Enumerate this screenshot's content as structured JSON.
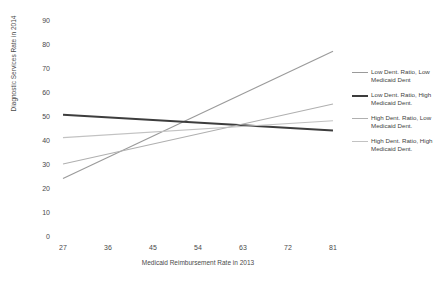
{
  "chart_data": {
    "type": "line",
    "title": "",
    "xlabel": "Medicaid Reimbursement Rate in 2013",
    "ylabel": "Diagnostic Services Rate in 2014",
    "xlim": [
      27,
      81
    ],
    "ylim": [
      0,
      90
    ],
    "xticks": [
      27,
      36,
      45,
      54,
      63,
      72,
      81
    ],
    "yticks": [
      0,
      10,
      20,
      30,
      40,
      50,
      60,
      70,
      80,
      90
    ],
    "grid": false,
    "legend_position": "right",
    "x": [
      27,
      81
    ],
    "series": [
      {
        "name": "Low Dent. Ratio, Low Medicaid Dent",
        "values": [
          24,
          77
        ],
        "color": "#9a9a9a",
        "width": 1.1
      },
      {
        "name": "Low Dent. Ratio, High Medicaid Dent.",
        "values": [
          50.5,
          44
        ],
        "color": "#3d3d3d",
        "width": 2.0
      },
      {
        "name": "High Dent. Ratio, Low Medicaid Dent.",
        "values": [
          30,
          55
        ],
        "color": "#b0b0b0",
        "width": 1.1
      },
      {
        "name": "High Dent. Ratio, High Medicaid Dent.",
        "values": [
          41,
          48
        ],
        "color": "#c2c2c2",
        "width": 1.1
      }
    ]
  },
  "axes": {
    "y_tick_labels": [
      "90",
      "80",
      "70",
      "60",
      "50",
      "40",
      "30",
      "20",
      "10",
      "0"
    ],
    "x_tick_labels": [
      "27",
      "36",
      "45",
      "54",
      "63",
      "72",
      "81"
    ],
    "x_title": "Medicaid Reimbursement Rate in 2013",
    "y_title": "Diagnostic Services Rate in 2014"
  },
  "legend": {
    "entries": [
      {
        "label": "Low Dent. Ratio, Low Medicaid Dent"
      },
      {
        "label": "Low Dent. Ratio, High Medicaid Dent."
      },
      {
        "label": "High Dent. Ratio, Low Medicaid Dent."
      },
      {
        "label": "High Dent. Ratio, High Medicaid Dent."
      }
    ]
  }
}
